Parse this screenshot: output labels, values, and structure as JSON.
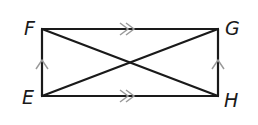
{
  "diagram": {
    "type": "rectangle-with-diagonals",
    "vertices": {
      "F": {
        "label": "F",
        "x": 42,
        "y": 29
      },
      "G": {
        "label": "G",
        "x": 218,
        "y": 29
      },
      "E": {
        "label": "E",
        "x": 42,
        "y": 96
      },
      "H": {
        "label": "H",
        "x": 218,
        "y": 96
      }
    },
    "segments": [
      "FG",
      "EH",
      "FE",
      "GH",
      "FH",
      "EG"
    ],
    "parallel_marks": {
      "double_arrow": [
        "FG",
        "EH"
      ],
      "single_arrow": [
        "EF",
        "HG"
      ]
    },
    "colors": {
      "line": "#1a1a1a",
      "marks": "#999999"
    }
  }
}
